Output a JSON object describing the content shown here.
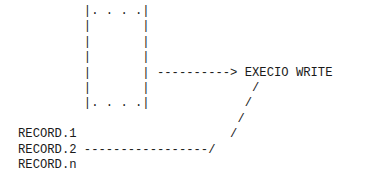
{
  "diagram": {
    "lines": [
      "         |. . . .|",
      "         |       |",
      "         |       |",
      "         |       |",
      "         |       | ----------> EXECIO WRITE",
      "         |       |              /",
      "         |. . . .|             /",
      "                              /",
      "RECORD.1                     /",
      "RECORD.2 -----------------/",
      "RECORD.n"
    ],
    "labels": {
      "target": "EXECIO WRITE",
      "records": [
        "RECORD.1",
        "RECORD.2",
        "RECORD.n"
      ]
    }
  }
}
